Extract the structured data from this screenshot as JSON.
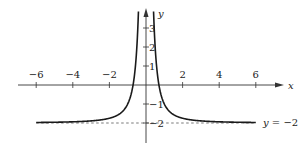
{
  "chart_data": {
    "type": "line",
    "title": "",
    "function": "y = 1/x^2 - 2",
    "xlabel": "x",
    "ylabel": "y",
    "xlim": [
      -6.2,
      7.2
    ],
    "ylim": [
      -3.2,
      4.5
    ],
    "x_ticks": [
      -6,
      -4,
      -2,
      2,
      4,
      6
    ],
    "x_tick_labels": [
      "−6",
      "−4",
      "−2",
      "2",
      "4",
      "6"
    ],
    "y_ticks": [
      3,
      2,
      1,
      -1,
      -2
    ],
    "y_tick_labels": [
      "3",
      "2",
      "1",
      "−1",
      "−2"
    ],
    "asymptotes": [
      {
        "type": "horizontal",
        "y": -2,
        "label": "y = −2",
        "style": "dashed"
      },
      {
        "type": "vertical",
        "x": 0
      }
    ],
    "series": [
      {
        "name": "left branch",
        "x": [
          -6,
          -4,
          -2,
          -1,
          -0.707,
          -0.5,
          -0.4
        ],
        "y": [
          -1.97,
          -1.94,
          -1.75,
          -1,
          0,
          2,
          4.25
        ]
      },
      {
        "name": "right branch",
        "x": [
          0.4,
          0.5,
          0.707,
          1,
          2,
          4,
          6
        ],
        "y": [
          4.25,
          2,
          0,
          -1,
          -1.75,
          -1.94,
          -1.97
        ]
      }
    ],
    "grid": false
  },
  "labels": {
    "x_axis": "x",
    "y_axis": "y",
    "asymptote": "y = −2"
  },
  "colors": {
    "curve": "#1a1a1a",
    "axis": "#333333",
    "asymptote": "#555555"
  }
}
